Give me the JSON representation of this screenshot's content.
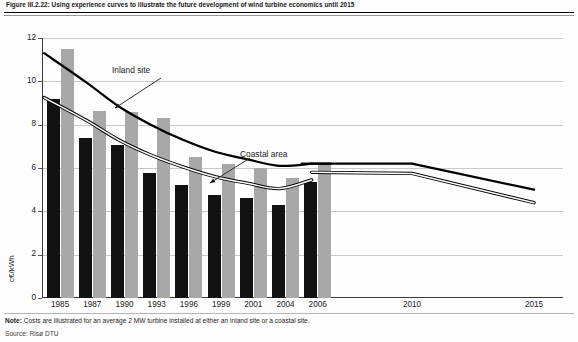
{
  "figure": {
    "title": "Figure III.2.22: Using experience curves to illustrate the future development of wind turbine economics until 2015",
    "note_label": "Note:",
    "note_text": " Costs are illustrated for an average 2 MW turbine installed at either an inland site or a coastal site.",
    "source": "Source: Risø DTU"
  },
  "annotations": {
    "inland": "Inland site",
    "coastal": "Coastal area"
  },
  "colors": {
    "bar_black": "#121212",
    "bar_gray": "#a8a8a8",
    "grid": "#c9c9c9",
    "axis": "#3a3a3a",
    "curve": "#000000"
  },
  "chart_data": {
    "type": "bar",
    "title": "Using experience curves to illustrate the future development of wind turbine economics until 2015",
    "xlabel": "",
    "ylabel": "c€/kWh",
    "ylim": [
      0,
      12
    ],
    "yticks": [
      0,
      2,
      4,
      6,
      8,
      10,
      12
    ],
    "ytick_labels": [
      "0",
      "2",
      "4",
      "6",
      "8",
      "10",
      "12"
    ],
    "grid": true,
    "legend": "none",
    "categories": [
      "1985",
      "1987",
      "1990",
      "1993",
      "1996",
      "1999",
      "2001",
      "2004",
      "2006"
    ],
    "series": [
      {
        "name": "Coastal area",
        "style": "bar",
        "color": "#121212",
        "values": [
          9.2,
          7.4,
          7.05,
          5.75,
          5.2,
          4.75,
          4.6,
          4.3,
          5.35
        ]
      },
      {
        "name": "Inland site",
        "style": "bar",
        "color": "#a8a8a8",
        "values": [
          11.5,
          8.65,
          8.6,
          8.3,
          6.5,
          6.2,
          6.0,
          5.55,
          6.2
        ]
      },
      {
        "name": "Inland site experience curve",
        "style": "line",
        "color": "#000000",
        "x": [
          "1985",
          "1987",
          "1990",
          "1993",
          "1996",
          "1999",
          "2001",
          "2004",
          "2006"
        ],
        "values": [
          11.3,
          9.95,
          8.85,
          8.0,
          7.3,
          6.75,
          6.4,
          6.1,
          6.2
        ]
      },
      {
        "name": "Coastal area experience curve",
        "style": "double-line",
        "color": "#000000",
        "x": [
          "1985",
          "1987",
          "1990",
          "1993",
          "1996",
          "1999",
          "2001",
          "2004",
          "2006"
        ],
        "values": [
          9.25,
          8.2,
          7.3,
          6.6,
          6.05,
          5.6,
          5.3,
          5.05,
          5.45
        ]
      }
    ],
    "projection": {
      "x": [
        "2006",
        "2010",
        "2015"
      ],
      "series": [
        {
          "name": "Inland site projection",
          "style": "line",
          "color": "#000000",
          "values": [
            6.2,
            6.2,
            5.0
          ]
        },
        {
          "name": "Coastal area projection",
          "style": "double-line",
          "color": "#000000",
          "values": [
            5.8,
            5.75,
            4.4
          ]
        }
      ]
    },
    "projection_ticks": [
      "2010",
      "2015"
    ]
  }
}
